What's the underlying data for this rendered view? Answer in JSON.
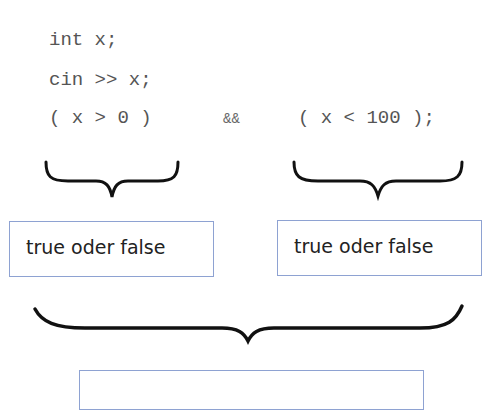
{
  "code": {
    "line1": "int x;",
    "line2": "cin >> x;",
    "line3_left": "( x > 0 )",
    "line3_op": "&&",
    "line3_right": "( x < 100 );"
  },
  "boxes": {
    "left": "true oder false",
    "right": "true oder false",
    "bottom": ""
  },
  "colors": {
    "box_border": "#8ea2d2",
    "code_text": "#555555",
    "brace": "#111111"
  }
}
